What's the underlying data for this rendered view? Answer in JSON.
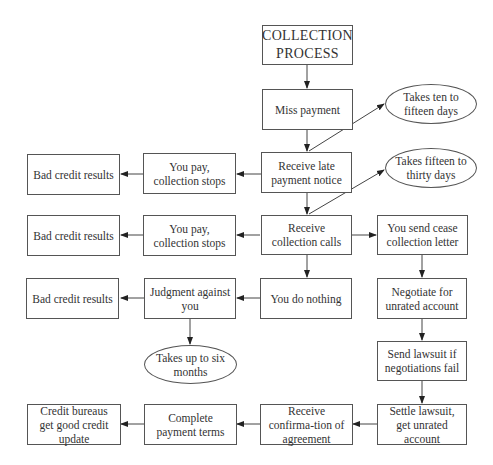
{
  "diagram": {
    "title": "COLLECTION PROCESS",
    "nodes": {
      "miss_payment": "Miss payment",
      "late_notice": "Receive late payment notice",
      "collection_calls": "Receive collection calls",
      "you_do_nothing": "You do nothing",
      "judgment": "Judgment against you",
      "pay_stops_1": "You pay, collection stops",
      "pay_stops_2": "You pay, collection stops",
      "bad_credit_1": "Bad credit results",
      "bad_credit_2": "Bad credit results",
      "bad_credit_3": "Bad credit results",
      "cease_letter": "You send cease collection letter",
      "negotiate": "Negotiate for unrated account",
      "send_lawsuit": "Send lawsuit if negotiations fail",
      "settle_lawsuit": "Settle lawsuit, get unrated account",
      "confirmation": "Receive confirma-tion of agreement",
      "complete_terms": "Complete payment terms",
      "good_credit": "Credit bureaus get good credit update"
    },
    "notes": {
      "ten_fifteen": "Takes ten to fifteen days",
      "fifteen_thirty": "Takes fifteen to thirty days",
      "six_months": "Takes up to six months"
    },
    "edges": [
      [
        "title",
        "miss_payment"
      ],
      [
        "miss_payment",
        "late_notice"
      ],
      [
        "late_notice",
        "ten_fifteen"
      ],
      [
        "late_notice",
        "pay_stops_1"
      ],
      [
        "pay_stops_1",
        "bad_credit_1"
      ],
      [
        "late_notice",
        "collection_calls"
      ],
      [
        "collection_calls",
        "fifteen_thirty"
      ],
      [
        "collection_calls",
        "pay_stops_2"
      ],
      [
        "pay_stops_2",
        "bad_credit_2"
      ],
      [
        "collection_calls",
        "cease_letter"
      ],
      [
        "collection_calls",
        "you_do_nothing"
      ],
      [
        "you_do_nothing",
        "judgment"
      ],
      [
        "judgment",
        "bad_credit_3"
      ],
      [
        "judgment",
        "six_months"
      ],
      [
        "cease_letter",
        "negotiate"
      ],
      [
        "negotiate",
        "send_lawsuit"
      ],
      [
        "send_lawsuit",
        "settle_lawsuit"
      ],
      [
        "settle_lawsuit",
        "confirmation"
      ],
      [
        "confirmation",
        "complete_terms"
      ],
      [
        "complete_terms",
        "good_credit"
      ]
    ]
  }
}
